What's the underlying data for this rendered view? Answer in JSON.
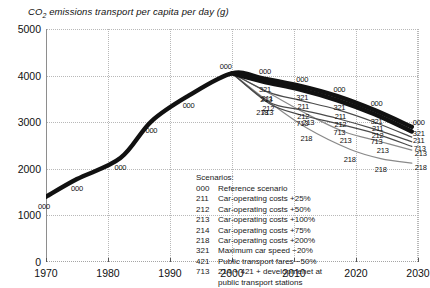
{
  "chart_data": {
    "type": "line",
    "title": "CO2 emissions transport per capita per day (g)",
    "title_main": "CO",
    "title_sub": "2",
    "title_rest": " emissions transport per capita per day (g)",
    "xlabel": "",
    "ylabel": "",
    "xlim": [
      1970,
      2030
    ],
    "ylim": [
      0,
      5000
    ],
    "grid": true,
    "legend_position": "inside-center",
    "x_ticks": [
      "1970",
      "1980",
      "1990",
      "2000",
      "2010",
      "2020",
      "2030"
    ],
    "x_tick_values": [
      1970,
      1980,
      1990,
      2000,
      2010,
      2020,
      2030
    ],
    "y_ticks": [
      "0",
      "1000",
      "2000",
      "3000",
      "4000",
      "5000"
    ],
    "y_tick_values": [
      0,
      1000,
      2000,
      3000,
      4000,
      5000
    ],
    "series": [
      {
        "name": "000",
        "label": "Reference scenario",
        "style": "thick-black",
        "x": [
          1970,
          1975,
          1982,
          1987,
          1993,
          2000,
          2005,
          2011,
          2017,
          2023,
          2029
        ],
        "values": [
          1400,
          1780,
          2230,
          3020,
          3570,
          4050,
          3940,
          3780,
          3560,
          3260,
          2900
        ]
      },
      {
        "name": "321",
        "label": "Maximum car speed -20%",
        "style": "thick-black",
        "x": [
          2000,
          2005,
          2011,
          2017,
          2023,
          2029
        ],
        "values": [
          4050,
          3870,
          3700,
          3470,
          3170,
          2800
        ]
      },
      {
        "name": "211",
        "label": "Car-operating costs +25%",
        "style": "thin-dark",
        "x": [
          2000,
          2006,
          2011,
          2017,
          2023,
          2029
        ],
        "values": [
          4050,
          3640,
          3470,
          3270,
          3000,
          2680
        ]
      },
      {
        "name": "212",
        "label": "Car-operating costs +50%",
        "style": "thin-dark",
        "x": [
          2000,
          2006,
          2011,
          2017,
          2023,
          2029
        ],
        "values": [
          4050,
          3430,
          3270,
          3080,
          2850,
          2580
        ]
      },
      {
        "name": "213",
        "label": "Car-operating costs +100%",
        "style": "thin-gray",
        "x": [
          2000,
          2006,
          2012,
          2018,
          2024,
          2029
        ],
        "values": [
          4050,
          3620,
          3180,
          2800,
          2580,
          2400
        ]
      },
      {
        "name": "218",
        "label": "Car-operating costs +200%",
        "style": "thin-gray",
        "x": [
          2000,
          2006,
          2012,
          2019,
          2024,
          2029
        ],
        "values": [
          4050,
          3430,
          2880,
          2420,
          2220,
          2120
        ]
      },
      {
        "name": "713",
        "label": "214 + 421 + developmenet at public transport stations",
        "style": "thin-dark",
        "x": [
          2000,
          2006,
          2011,
          2017,
          2023,
          2029
        ],
        "values": [
          4050,
          3400,
          3160,
          2970,
          2760,
          2480
        ]
      }
    ],
    "point_labels": [
      {
        "series": "000",
        "x": 1970,
        "y": 1400,
        "dx": -2,
        "dy": 9,
        "text": "000"
      },
      {
        "series": "000",
        "x": 1975,
        "y": 1780,
        "dx": 0,
        "dy": 9,
        "text": "000"
      },
      {
        "series": "000",
        "x": 1982,
        "y": 2230,
        "dx": 0,
        "dy": 9,
        "text": "000"
      },
      {
        "series": "000",
        "x": 1987,
        "y": 3020,
        "dx": 0,
        "dy": 9,
        "text": "000"
      },
      {
        "series": "000",
        "x": 1993,
        "y": 3570,
        "dx": 0,
        "dy": 9,
        "text": "000"
      },
      {
        "series": "000",
        "x": 1999,
        "y": 4050,
        "dx": 0,
        "dy": -7,
        "text": "000"
      },
      {
        "series": "000",
        "x": 2005,
        "y": 3940,
        "dx": 2,
        "dy": -7,
        "text": "000"
      },
      {
        "series": "000",
        "x": 2011,
        "y": 3780,
        "dx": 2,
        "dy": -7,
        "text": "000"
      },
      {
        "series": "000",
        "x": 2017,
        "y": 3560,
        "dx": 2,
        "dy": -7,
        "text": "000"
      },
      {
        "series": "000",
        "x": 2023,
        "y": 3260,
        "dx": 2,
        "dy": -7,
        "text": "000"
      },
      {
        "series": "000",
        "x": 2029,
        "y": 2900,
        "dx": 7,
        "dy": -5,
        "text": "000"
      },
      {
        "series": "321",
        "x": 2005,
        "y": 3870,
        "dx": 2,
        "dy": 7,
        "text": "321"
      },
      {
        "series": "321",
        "x": 2011,
        "y": 3700,
        "dx": 2,
        "dy": 7,
        "text": "321"
      },
      {
        "series": "321",
        "x": 2017,
        "y": 3470,
        "dx": 2,
        "dy": 7,
        "text": "321"
      },
      {
        "series": "321",
        "x": 2023,
        "y": 3170,
        "dx": 2,
        "dy": 7,
        "text": "321"
      },
      {
        "series": "321",
        "x": 2029,
        "y": 2800,
        "dx": 7,
        "dy": 1,
        "text": "321"
      },
      {
        "series": "211",
        "x": 2006,
        "y": 3640,
        "dx": -2,
        "dy": 6,
        "text": "211"
      },
      {
        "series": "211",
        "x": 2011,
        "y": 3470,
        "dx": 3,
        "dy": 6,
        "text": "211"
      },
      {
        "series": "211",
        "x": 2017,
        "y": 3270,
        "dx": 3,
        "dy": 6,
        "text": "211"
      },
      {
        "series": "211",
        "x": 2023,
        "y": 3000,
        "dx": 3,
        "dy": 6,
        "text": "211"
      },
      {
        "series": "211",
        "x": 2029,
        "y": 2680,
        "dx": 7,
        "dy": 3,
        "text": "211"
      },
      {
        "series": "212",
        "x": 2006,
        "y": 3430,
        "dx": -1,
        "dy": 6,
        "text": "212"
      },
      {
        "series": "212",
        "x": 2011,
        "y": 3270,
        "dx": 3,
        "dy": 6,
        "text": "212"
      },
      {
        "series": "212",
        "x": 2017,
        "y": 3080,
        "dx": 3,
        "dy": 6,
        "text": "212"
      },
      {
        "series": "212",
        "x": 2023,
        "y": 2850,
        "dx": 3,
        "dy": 6,
        "text": "212"
      },
      {
        "series": "713",
        "x": 2006,
        "y": 3400,
        "dx": -2,
        "dy": 8,
        "text": "713"
      },
      {
        "series": "713",
        "x": 2011,
        "y": 3160,
        "dx": 2,
        "dy": 8,
        "text": "713"
      },
      {
        "series": "713",
        "x": 2017,
        "y": 2970,
        "dx": 2,
        "dy": 8,
        "text": "713"
      },
      {
        "series": "713",
        "x": 2023,
        "y": 2760,
        "dx": 2,
        "dy": 8,
        "text": "713"
      },
      {
        "series": "713",
        "x": 2029,
        "y": 2480,
        "dx": 8,
        "dy": 2,
        "text": "713"
      },
      {
        "series": "213",
        "x": 2006,
        "y": 3620,
        "dx": -3,
        "dy": 6,
        "text": "213"
      },
      {
        "series": "213",
        "x": 2012,
        "y": 3180,
        "dx": 2,
        "dy": 8,
        "text": "213"
      },
      {
        "series": "213",
        "x": 2018,
        "y": 2800,
        "dx": 2,
        "dy": 8,
        "text": "213"
      },
      {
        "series": "213",
        "x": 2024,
        "y": 2580,
        "dx": 2,
        "dy": 8,
        "text": "213"
      },
      {
        "series": "213",
        "x": 2029,
        "y": 2400,
        "dx": 9,
        "dy": 3,
        "text": "213"
      },
      {
        "series": "218",
        "x": 2006,
        "y": 3430,
        "dx": -7,
        "dy": 10,
        "text": "218"
      },
      {
        "series": "218",
        "x": 2012,
        "y": 2880,
        "dx": 0,
        "dy": 10,
        "text": "218"
      },
      {
        "series": "218",
        "x": 2019,
        "y": 2420,
        "dx": 0,
        "dy": 10,
        "text": "218"
      },
      {
        "series": "218",
        "x": 2024,
        "y": 2220,
        "dx": 0,
        "dy": 10,
        "text": "218"
      },
      {
        "series": "218",
        "x": 2029,
        "y": 2120,
        "dx": 9,
        "dy": 4,
        "text": "218"
      }
    ]
  },
  "legend": {
    "heading": "Scenarios:",
    "entries": [
      {
        "code": "000",
        "label": "Reference scenario"
      },
      {
        "code": "211",
        "label": "Car-operating costs +25%"
      },
      {
        "code": "212",
        "label": "Car-operating costs +50%"
      },
      {
        "code": "213",
        "label": "Car-operating costs +100%"
      },
      {
        "code": "214",
        "label": "Car-operating costs +75%"
      },
      {
        "code": "218",
        "label": "Car-operating costs +200%"
      },
      {
        "code": "321",
        "label": "Maximum car speed −20%"
      },
      {
        "code": "421",
        "label": "Public transport fares −50%"
      },
      {
        "code": "713",
        "label": "214 + 421 + developmenet at",
        "continuation": "public transport stations"
      }
    ]
  },
  "colors": {
    "line_primary": "#111111",
    "line_secondary": "#4a4a4a",
    "line_tertiary": "#8a8a8a",
    "grid": "#b8b8b8",
    "axis": "#8e8e8e",
    "text": "#111111",
    "background": "#ffffff"
  }
}
